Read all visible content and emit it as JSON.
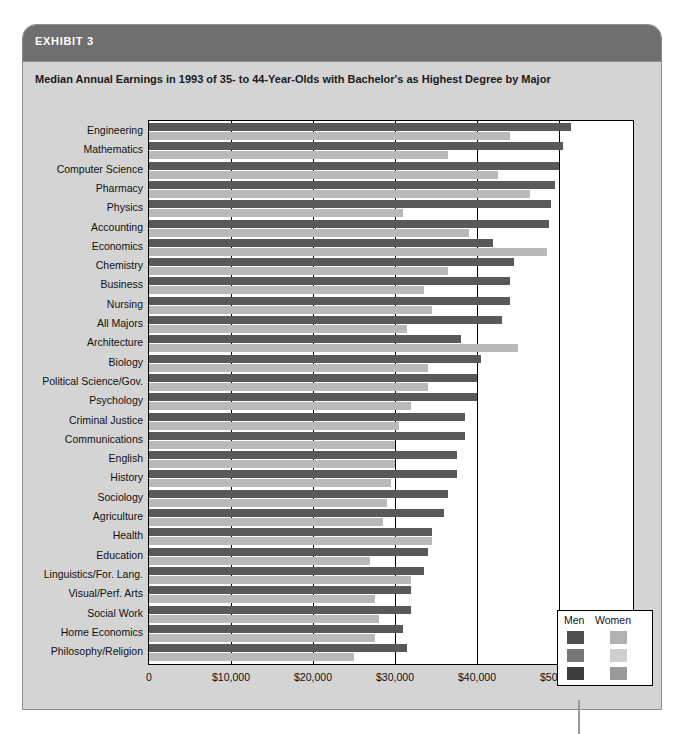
{
  "exhibit": {
    "label": "EXHIBIT 3",
    "subtitle": "Median Annual Earnings in 1993 of 35- to 44-Year-Olds with Bachelor's as Highest Degree by Major"
  },
  "legend": {
    "men_label": "Men",
    "women_label": "Women",
    "men_color": "#595959",
    "women_color": "#b9b9b9",
    "position": "inside-bottom-right"
  },
  "chart_data": {
    "type": "bar",
    "orientation": "horizontal",
    "title": "Median Annual Earnings in 1993 of 35- to 44-Year-Olds with Bachelor's as Highest Degree by Major",
    "xlabel": "",
    "ylabel": "",
    "xlim": [
      0,
      52000
    ],
    "grid": true,
    "tick_labels": [
      "0",
      "$10,000",
      "$20,000",
      "$30,000",
      "$40,000",
      "$50,000"
    ],
    "tick_values": [
      0,
      10000,
      20000,
      30000,
      40000,
      50000
    ],
    "categories": [
      "Engineering",
      "Mathematics",
      "Computer Science",
      "Pharmacy",
      "Physics",
      "Accounting",
      "Economics",
      "Chemistry",
      "Business",
      "Nursing",
      "All Majors",
      "Architecture",
      "Biology",
      "Political Science/Gov.",
      "Psychology",
      "Criminal Justice",
      "Communications",
      "English",
      "History",
      "Sociology",
      "Agriculture",
      "Health",
      "Education",
      "Linguistics/For. Lang.",
      "Visual/Perf. Arts",
      "Social Work",
      "Home Economics",
      "Philosophy/Religion"
    ],
    "series": [
      {
        "name": "Men",
        "color": "#595959",
        "values": [
          51500,
          50500,
          50000,
          49500,
          49000,
          48800,
          42000,
          44500,
          44000,
          44000,
          43000,
          38000,
          40500,
          40000,
          40000,
          38500,
          38500,
          37500,
          37500,
          36500,
          36000,
          34500,
          34000,
          33500,
          32000,
          32000,
          31000,
          31500
        ]
      },
      {
        "name": "Women",
        "color": "#b9b9b9",
        "values": [
          44000,
          36500,
          42500,
          46500,
          31000,
          39000,
          48500,
          36500,
          33500,
          34500,
          31500,
          45000,
          34000,
          34000,
          32000,
          30500,
          30000,
          30000,
          29500,
          29000,
          28500,
          34500,
          27000,
          32000,
          27500,
          28000,
          27500,
          25000
        ]
      }
    ]
  }
}
